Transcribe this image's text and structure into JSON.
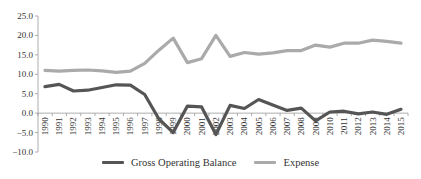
{
  "chart_data": {
    "type": "line",
    "title": "",
    "xlabel": "",
    "ylabel": "",
    "ylim": [
      -10,
      25
    ],
    "yticks": [
      25.0,
      20.0,
      15.0,
      10.0,
      5.0,
      0.0,
      -5.0,
      -10.0
    ],
    "ytick_labels": [
      "25.0",
      "20.0",
      "15.0",
      "10.0",
      "5.0",
      "0.0",
      "−5.0",
      "−10.0"
    ],
    "grid": false,
    "legend_position": "bottom",
    "categories": [
      "1990",
      "1991",
      "1992",
      "1993",
      "1994",
      "1995",
      "1996",
      "1997",
      "1998",
      "1999",
      "2000",
      "2001",
      "2002",
      "2003",
      "2004",
      "2005",
      "2006",
      "2007",
      "2008",
      "2009",
      "2010",
      "2011",
      "2012",
      "2013",
      "2014",
      "2015"
    ],
    "series": [
      {
        "name": "Gross Operating Balance",
        "color": "#555555",
        "values": [
          6.8,
          7.4,
          5.7,
          5.9,
          6.6,
          7.3,
          7.2,
          4.8,
          -1.5,
          -5.0,
          1.8,
          1.6,
          -5.5,
          2.0,
          1.2,
          3.5,
          2.1,
          0.7,
          1.3,
          -2.0,
          0.3,
          0.5,
          -0.2,
          0.3,
          -0.3,
          1.0
        ]
      },
      {
        "name": "Expense",
        "color": "#aaaaaa",
        "values": [
          11.0,
          10.8,
          11.0,
          11.1,
          10.9,
          10.5,
          10.8,
          12.8,
          16.2,
          19.3,
          13.0,
          14.0,
          20.0,
          14.6,
          15.6,
          15.2,
          15.5,
          16.1,
          16.1,
          17.5,
          17.0,
          18.0,
          18.0,
          18.8,
          18.5,
          18.0
        ]
      }
    ]
  },
  "legend": {
    "items": [
      {
        "label": "Gross Operating Balance",
        "color": "#555555"
      },
      {
        "label": "Expense",
        "color": "#aaaaaa"
      }
    ]
  }
}
